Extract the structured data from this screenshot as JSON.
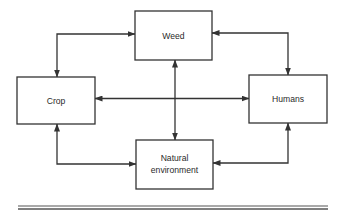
{
  "diagram": {
    "nodes": [
      {
        "id": "weed",
        "label": "Weed",
        "x": 135,
        "y": 11,
        "w": 77,
        "h": 49
      },
      {
        "id": "crop",
        "label": "Crop",
        "x": 17,
        "y": 77,
        "w": 78,
        "h": 47
      },
      {
        "id": "humans",
        "label": "Humans",
        "x": 249,
        "y": 75,
        "w": 78,
        "h": 48
      },
      {
        "id": "natural",
        "label_line1": "Natural",
        "label_line2": "environment",
        "x": 136,
        "y": 140,
        "w": 77,
        "h": 49
      }
    ],
    "edges": [
      {
        "from": "crop",
        "to": "weed",
        "type": "bidirectional"
      },
      {
        "from": "weed",
        "to": "humans",
        "type": "bidirectional"
      },
      {
        "from": "crop",
        "to": "natural",
        "type": "bidirectional"
      },
      {
        "from": "natural",
        "to": "humans",
        "type": "bidirectional"
      },
      {
        "from": "crop",
        "to": "humans",
        "type": "bidirectional"
      },
      {
        "from": "weed",
        "to": "natural",
        "type": "bidirectional"
      }
    ],
    "colors": {
      "stroke": "#333333",
      "text": "#2a2a2a",
      "background": "#ffffff"
    }
  }
}
